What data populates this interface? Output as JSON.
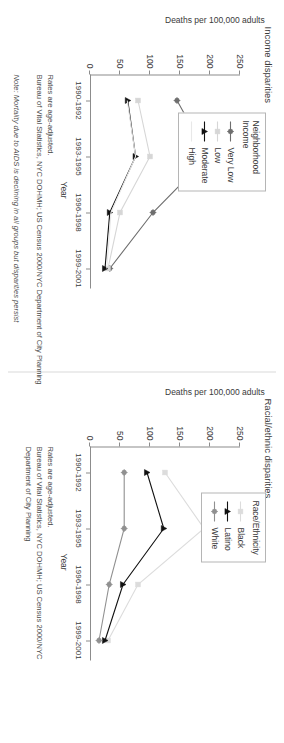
{
  "figure": {
    "note": "Note: Mortality due to AIDS is declining in all groups but disparities persist"
  },
  "panels": {
    "left": {
      "title": "Income disparities",
      "ylabel": "Deaths per 100,000 adults",
      "xlabel": "Year",
      "yticks": [
        "0",
        "50",
        "100",
        "150",
        "200",
        "250"
      ],
      "xticks": [
        "1990-1992",
        "1993-1995",
        "1996-1998",
        "1999-2001"
      ],
      "legend_title_line1": "Neighborhood",
      "legend_title_line2": "Income",
      "legend": [
        {
          "label": "Very Low",
          "color": "#6e6e6e",
          "marker": "circle"
        },
        {
          "label": "Low",
          "color": "#d6d6d6",
          "marker": "square"
        },
        {
          "label": "Moderate",
          "color": "#111111",
          "marker": "triangle"
        },
        {
          "label": "High",
          "color": "#e8e8e8",
          "marker": "none"
        }
      ],
      "footnotes": [
        "Rates are age-adjusted.",
        "Bureau of Vital Statistics, NYC DOHMH; US Census 2000/NYC Department of City Planning"
      ]
    },
    "right": {
      "title": "Racial/ethnic disparities",
      "ylabel": "Deaths per 100,000 adults",
      "xlabel": "Year",
      "yticks": [
        "0",
        "50",
        "100",
        "150",
        "200",
        "250"
      ],
      "xticks": [
        "1990-1992",
        "1993-1995",
        "1996-1998",
        "1999-2001"
      ],
      "legend_title_line1": "Race/Ethnicity",
      "legend_title_line2": "",
      "legend": [
        {
          "label": "Black",
          "color": "#dcdcdc",
          "marker": "square"
        },
        {
          "label": "Latino",
          "color": "#111111",
          "marker": "triangle"
        },
        {
          "label": "White",
          "color": "#909090",
          "marker": "circle"
        }
      ],
      "footnotes": [
        "Rates are age-adjusted.",
        "Bureau of Vital Statistics, NYC DOHMH; US Census 2000/NYC",
        "Department of City Planning"
      ]
    }
  },
  "chart_data": [
    {
      "type": "line",
      "panel": "left",
      "title": "Income disparities",
      "xlabel": "Year",
      "ylabel": "Deaths per 100,000 adults",
      "categories": [
        "1990-1992",
        "1993-1995",
        "1996-1998",
        "1999-2001"
      ],
      "ylim": [
        0,
        250
      ],
      "yticks": [
        0,
        50,
        100,
        150,
        200,
        250
      ],
      "grid": false,
      "legend": "top-right",
      "legend_title": "Neighborhood Income",
      "series": [
        {
          "name": "Very Low",
          "values": [
            145,
            197,
            105,
            33
          ],
          "color": "#6e6e6e",
          "marker": "circle"
        },
        {
          "name": "Low",
          "values": [
            80,
            100,
            50,
            30
          ],
          "color": "#d6d6d6",
          "marker": "square"
        },
        {
          "name": "Moderate",
          "values": [
            63,
            76,
            33,
            25
          ],
          "color": "#111111",
          "marker": "triangle"
        },
        {
          "name": "High",
          "values": [
            62,
            76,
            35,
            28
          ],
          "color": "#e8e8e8",
          "marker": "none"
        }
      ]
    },
    {
      "type": "line",
      "panel": "right",
      "title": "Racial/ethnic disparities",
      "xlabel": "Year",
      "ylabel": "Deaths per 100,000 adults",
      "categories": [
        "1990-1992",
        "1993-1995",
        "1996-1998",
        "1999-2001"
      ],
      "ylim": [
        0,
        250
      ],
      "yticks": [
        0,
        50,
        100,
        150,
        200,
        250
      ],
      "grid": false,
      "legend": "top-right",
      "legend_title": "Race/Ethnicity",
      "series": [
        {
          "name": "Black",
          "values": [
            125,
            190,
            80,
            30
          ],
          "color": "#dcdcdc",
          "marker": "square"
        },
        {
          "name": "Latino",
          "values": [
            95,
            123,
            55,
            25
          ],
          "color": "#111111",
          "marker": "triangle"
        },
        {
          "name": "White",
          "values": [
            57,
            57,
            32,
            15
          ],
          "color": "#909090",
          "marker": "circle"
        }
      ]
    }
  ]
}
